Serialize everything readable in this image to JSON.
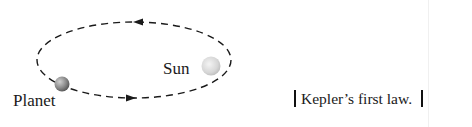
{
  "figure": {
    "type": "orbit-diagram",
    "bodies": [
      {
        "name": "planet",
        "label": "Planet"
      },
      {
        "name": "sun",
        "label": "Sun"
      }
    ],
    "orbit": {
      "style": "dashed-ellipse",
      "direction": "counterclockwise"
    },
    "caption": "Kepler’s first law.",
    "colors": {
      "line": "#1a1a1a",
      "planet": "#8a8a8a",
      "sun": "#d8d8d8",
      "background": "#ffffff"
    }
  }
}
